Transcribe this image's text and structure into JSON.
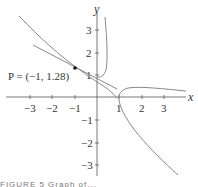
{
  "figure": {
    "axes": {
      "x_label": "x",
      "y_label": "y",
      "x_ticks": [
        "−3",
        "−2",
        "−1",
        "1",
        "2",
        "3"
      ],
      "y_ticks": [
        "3",
        "2",
        "1",
        "−1",
        "−2",
        "−3"
      ]
    },
    "point_label": "P = (−1, 1.28)",
    "point": {
      "x": -1,
      "y": 1.28
    },
    "caption": "FIGURE 5  Graph of..."
  },
  "colors": {
    "curve": "#888888",
    "axes": "#555555",
    "point": "#111111"
  }
}
